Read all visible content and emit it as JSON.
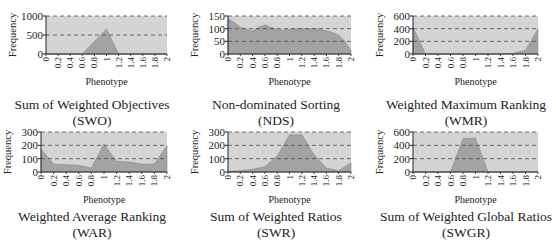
{
  "chart_data": [
    {
      "type": "area",
      "title": "Sum of Weighted Objectives",
      "abbr": "(SWO)",
      "xlabel": "Phenotype",
      "ylabel": "Frequency",
      "ylim": [
        0,
        1000
      ],
      "yticks": [
        "0",
        "500",
        "1000"
      ],
      "xticks": [
        "0",
        "0.2",
        "0.4",
        "0.6",
        "0.8",
        "1",
        "1.2",
        "1.4",
        "1.6",
        "1.8",
        "2"
      ],
      "grid": "dashed horizontal",
      "x": [
        0,
        0.2,
        0.4,
        0.6,
        0.8,
        1.0,
        1.2,
        1.4,
        1.6,
        1.8,
        2.0
      ],
      "values": [
        0,
        0,
        0,
        0,
        330,
        660,
        0,
        0,
        0,
        0,
        0
      ]
    },
    {
      "type": "area",
      "title": "Non-dominated Sorting",
      "abbr": "(NDS)",
      "xlabel": "Phenotype",
      "ylabel": "Frequency",
      "ylim": [
        0,
        150
      ],
      "yticks": [
        "0",
        "50",
        "100",
        "150"
      ],
      "xticks": [
        "0",
        "0.2",
        "0.4",
        "0.6",
        "0.8",
        "1",
        "1.2",
        "1.4",
        "1.6",
        "1.8",
        "2"
      ],
      "grid": "dashed horizontal",
      "x": [
        0,
        0.1,
        0.2,
        0.3,
        0.4,
        0.5,
        0.6,
        0.7,
        0.8,
        0.9,
        1.0,
        1.1,
        1.2,
        1.3,
        1.4,
        1.5,
        1.6,
        1.7,
        1.8,
        1.9,
        2.0
      ],
      "values": [
        140,
        125,
        105,
        97,
        92,
        105,
        115,
        105,
        97,
        95,
        98,
        99,
        100,
        100,
        100,
        97,
        92,
        85,
        75,
        50,
        15
      ]
    },
    {
      "type": "area",
      "title": "Weighted Maximum Ranking",
      "abbr": "(WMR)",
      "xlabel": "Phenotype",
      "ylabel": "Frequency",
      "ylim": [
        0,
        600
      ],
      "yticks": [
        "0",
        "200",
        "400",
        "600"
      ],
      "xticks": [
        "0",
        "0.2",
        "0.4",
        "0.6",
        "0.8",
        "1",
        "1.2",
        "1.4",
        "1.6",
        "1.8",
        "2"
      ],
      "grid": "dashed horizontal",
      "x": [
        0,
        0.2,
        0.4,
        0.6,
        0.8,
        1.0,
        1.2,
        1.4,
        1.6,
        1.8,
        2.0
      ],
      "values": [
        420,
        0,
        0,
        0,
        0,
        0,
        0,
        0,
        10,
        60,
        400
      ]
    },
    {
      "type": "area",
      "title": "Weighted Average Ranking",
      "abbr": "(WAR)",
      "xlabel": "Phenotype",
      "ylabel": "Frequency",
      "ylim": [
        0,
        300
      ],
      "yticks": [
        "0",
        "100",
        "200",
        "300"
      ],
      "xticks": [
        "0",
        "0.2",
        "0.4",
        "0.6",
        "0.8",
        "1",
        "1.2",
        "1.4",
        "1.6",
        "1.8",
        "2"
      ],
      "grid": "dashed horizontal",
      "x": [
        0,
        0.2,
        0.4,
        0.6,
        0.8,
        1.0,
        1.2,
        1.4,
        1.6,
        1.8,
        2.0
      ],
      "values": [
        170,
        60,
        55,
        50,
        30,
        210,
        80,
        75,
        60,
        60,
        200
      ]
    },
    {
      "type": "area",
      "title": "Sum of Weighted Ratios",
      "abbr": "(SWR)",
      "xlabel": "Phenotype",
      "ylabel": "Frequency",
      "ylim": [
        0,
        300
      ],
      "yticks": [
        "0",
        "100",
        "200",
        "300"
      ],
      "xticks": [
        "0",
        "0.2",
        "0.4",
        "0.6",
        "0.8",
        "1",
        "1.2",
        "1.4",
        "1.6",
        "1.8",
        "2"
      ],
      "grid": "dashed horizontal",
      "x": [
        0,
        0.2,
        0.4,
        0.6,
        0.8,
        1.0,
        1.2,
        1.4,
        1.6,
        1.8,
        2.0
      ],
      "values": [
        5,
        10,
        20,
        40,
        120,
        280,
        280,
        130,
        30,
        10,
        70
      ]
    },
    {
      "type": "area",
      "title": "Sum of Weighted Global Ratios",
      "abbr": "(SWGR)",
      "xlabel": "Phenotype",
      "ylabel": "Frequency",
      "ylim": [
        0,
        600
      ],
      "yticks": [
        "0",
        "200",
        "400",
        "600"
      ],
      "xticks": [
        "0",
        "0.2",
        "0.4",
        "0.6",
        "0.8",
        "1",
        "1.2",
        "1.4",
        "1.6",
        "1.8",
        "2"
      ],
      "grid": "dashed horizontal",
      "x": [
        0,
        0.2,
        0.4,
        0.6,
        0.8,
        1.0,
        1.2,
        1.4,
        1.6,
        1.8,
        2.0
      ],
      "values": [
        0,
        0,
        0,
        0,
        500,
        510,
        0,
        0,
        0,
        0,
        0
      ]
    }
  ],
  "colors": {
    "plot_bg": "#d4d4d4",
    "area_fill": "#a3a3a3",
    "grid": "#4a4a4a",
    "axis": "#222222"
  }
}
